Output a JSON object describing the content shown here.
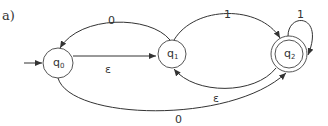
{
  "panel_label": "a)",
  "states": [
    {
      "id": "q0",
      "name": "q",
      "sub": "0",
      "accepting": false,
      "start": true
    },
    {
      "id": "q1",
      "name": "q",
      "sub": "1",
      "accepting": false,
      "start": false
    },
    {
      "id": "q2",
      "name": "q",
      "sub": "2",
      "accepting": true,
      "start": false
    }
  ],
  "transitions": [
    {
      "from": "q1",
      "to": "q0",
      "label": "0"
    },
    {
      "from": "q0",
      "to": "q1",
      "label": "ε"
    },
    {
      "from": "q1",
      "to": "q2",
      "label": "1"
    },
    {
      "from": "q2",
      "to": "q2",
      "label": "1"
    },
    {
      "from": "q2",
      "to": "q1",
      "label": "ε"
    },
    {
      "from": "q0",
      "to": "q2",
      "label": "0"
    }
  ],
  "colors": {
    "stroke": "#333333",
    "background": "#ffffff"
  }
}
